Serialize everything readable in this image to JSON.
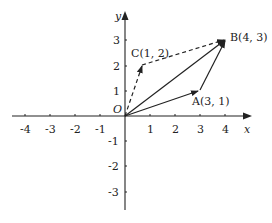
{
  "diagram": {
    "type": "vector-diagram",
    "axes": {
      "x_label": "x",
      "y_label": "y",
      "origin_label": "O",
      "x_ticks": [
        "-4",
        "-3",
        "-2",
        "-1",
        "1",
        "2",
        "3",
        "4"
      ],
      "y_ticks": [
        "3",
        "2",
        "1",
        "-1",
        "-2",
        "-3"
      ]
    },
    "points": {
      "A": {
        "label": "A(3, 1)",
        "x": 3,
        "y": 1
      },
      "B": {
        "label": "B(4, 3)",
        "x": 4,
        "y": 3
      },
      "C": {
        "label": "C(1, 2)",
        "x": 1,
        "y": 2
      }
    },
    "vectors": [
      {
        "from": "O",
        "to": "A",
        "style": "solid"
      },
      {
        "from": "O",
        "to": "B",
        "style": "solid"
      },
      {
        "from": "A",
        "to": "B",
        "style": "solid"
      },
      {
        "from": "O",
        "to": "C",
        "style": "dashed"
      },
      {
        "from": "C",
        "to": "B",
        "style": "dashed"
      }
    ],
    "colors": {
      "stroke": "#222222",
      "background": "#ffffff"
    }
  }
}
